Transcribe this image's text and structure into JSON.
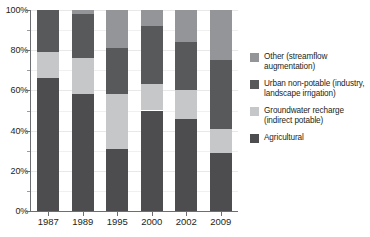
{
  "chart_data": {
    "type": "bar",
    "subtype": "stacked-bar-100-percent",
    "title": "",
    "subtitle": "",
    "xlabel": "",
    "ylabel": "",
    "categories": [
      "1987",
      "1989",
      "1995",
      "2000",
      "2002",
      "2009"
    ],
    "ylim": [
      0,
      100
    ],
    "yticks": [
      0,
      20,
      40,
      60,
      80,
      100
    ],
    "ytick_labels": [
      "0%",
      "20%",
      "40%",
      "60%",
      "80%",
      "100%"
    ],
    "y_minor_ticks": [
      10,
      30,
      50,
      70,
      90
    ],
    "grid": true,
    "grid_axis": "y",
    "legend_position": "right",
    "stack_order_bottom_to_top": [
      "Agricultural",
      "Groundwater recharge (indirect potable)",
      "Urban non-potable (industry, landscape irrigation)",
      "Other (streamflow augmentation)"
    ],
    "series": [
      {
        "name": "Agricultural",
        "color": "#4d4d4f",
        "values": [
          66,
          58,
          31,
          50,
          46,
          29
        ]
      },
      {
        "name": "Groundwater recharge (indirect potable)",
        "color": "#c6c7c9",
        "values": [
          13,
          18,
          27,
          13,
          14,
          12
        ]
      },
      {
        "name": "Urban non-potable (industry, landscape irrigation)",
        "color": "#58595b",
        "values": [
          21,
          22,
          23,
          29,
          24,
          34
        ]
      },
      {
        "name": "Other (streamflow augmentation)",
        "color": "#939598",
        "values": [
          0,
          2,
          19,
          8,
          16,
          25
        ]
      }
    ]
  },
  "legend": {
    "items": [
      {
        "label": "Other (streamflow augmentation)",
        "color": "#939598",
        "swatch_icon": "legend-swatch-icon"
      },
      {
        "label": "Urban non-potable (industry, landscape irrigation)",
        "color": "#58595b",
        "swatch_icon": "legend-swatch-icon"
      },
      {
        "label": "Groundwater recharge (indirect potable)",
        "color": "#c6c7c9",
        "swatch_icon": "legend-swatch-icon"
      },
      {
        "label": "Agricultural",
        "color": "#4d4d4f",
        "swatch_icon": "legend-swatch-icon"
      }
    ]
  },
  "axes": {
    "y_tick_labels": [
      "100%",
      "80%",
      "60%",
      "40%",
      "20%",
      "0%"
    ],
    "x_tick_labels": [
      "1987",
      "1989",
      "1995",
      "2000",
      "2002",
      "2009"
    ]
  },
  "colors": {
    "axis": "#6d6e71",
    "grid": "#e8e8e8",
    "text": "#231f20",
    "background": "#ffffff"
  }
}
